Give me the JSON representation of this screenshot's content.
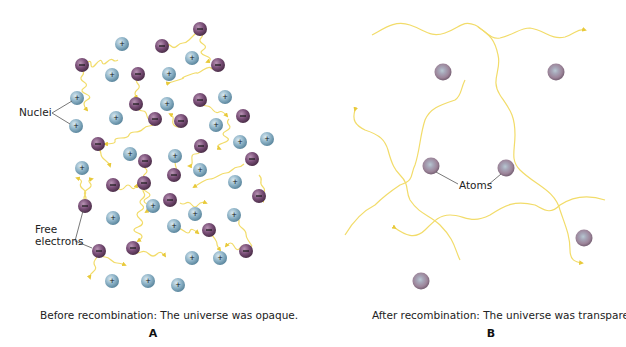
{
  "figure": {
    "panels": [
      {
        "id": "A",
        "letter": "A",
        "caption": "Before recombination:  The universe was opaque.",
        "labels": {
          "nuclei": "Nuclei",
          "free_electrons_line1": "Free",
          "free_electrons_line2": "electrons"
        },
        "nuclei_symbol": "+",
        "electron_symbol": "−"
      },
      {
        "id": "B",
        "letter": "B",
        "caption": "After recombination:  The universe was transparent.",
        "labels": {
          "atoms": "Atoms"
        }
      }
    ],
    "colors": {
      "nucleus": "#8fb4c8",
      "nucleus_dark": "#5d889f",
      "electron": "#7a4f78",
      "electron_dark": "#54334f",
      "atom": "#a88fa5",
      "atom_core": "#9fb0bc",
      "photon": "#f2dc6a",
      "photon_arrow": "#e8c93a",
      "leader_line": "#555555",
      "text": "#222222"
    }
  }
}
